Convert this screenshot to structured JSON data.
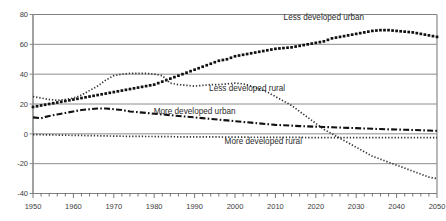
{
  "chart_data": {
    "type": "line",
    "title": "",
    "subtitle": "",
    "xlabel": "",
    "ylabel": "",
    "xlim": [
      1950,
      2050
    ],
    "ylim": [
      -40,
      80
    ],
    "ytick_values": [
      -40,
      -20,
      0,
      20,
      40,
      60,
      80
    ],
    "ytick_labels": [
      "-40",
      "-20",
      "0",
      "20",
      "40",
      "60",
      "80"
    ],
    "xtick_values": [
      1950,
      1960,
      1970,
      1980,
      1990,
      2000,
      2010,
      2020,
      2030,
      2040,
      2050
    ],
    "xtick_labels": [
      "1950",
      "1960",
      "1970",
      "1980",
      "1990",
      "2000",
      "2010",
      "2020",
      "2030",
      "2040",
      "2050"
    ],
    "x_minor_tick_step": 2,
    "grid": "horizontal",
    "grid_color": "#808080",
    "frame_color": "#8a8a8a",
    "legend": "inline-annotations",
    "x": [
      1950,
      1952,
      1954,
      1956,
      1958,
      1960,
      1962,
      1964,
      1966,
      1968,
      1970,
      1972,
      1974,
      1976,
      1978,
      1980,
      1982,
      1984,
      1986,
      1988,
      1990,
      1992,
      1994,
      1996,
      1998,
      2000,
      2002,
      2004,
      2006,
      2008,
      2010,
      2012,
      2014,
      2016,
      2018,
      2020,
      2022,
      2024,
      2026,
      2028,
      2030,
      2032,
      2034,
      2036,
      2038,
      2040,
      2042,
      2044,
      2046,
      2048,
      2050
    ],
    "series": [
      {
        "name": "Less developed urban",
        "style": "dotted-square",
        "color": "#111111",
        "label_x": 2022,
        "label_y": 76,
        "values": [
          18,
          19,
          20,
          21,
          22,
          23,
          24,
          25,
          26,
          27,
          28,
          29,
          30,
          31,
          32,
          33,
          35,
          37,
          39,
          41,
          43,
          45,
          47,
          49,
          50,
          52,
          53,
          54,
          55,
          56,
          57,
          57.5,
          58,
          59,
          60,
          61,
          62,
          64,
          65,
          66,
          67,
          68,
          69,
          69.5,
          69.5,
          69,
          68.5,
          68,
          67,
          66,
          65
        ]
      },
      {
        "name": "Less developed rural",
        "style": "dotted-fine",
        "color": "#333333",
        "label_x": 2003,
        "label_y": 29,
        "values": [
          25,
          24,
          23,
          22.5,
          23,
          24,
          26,
          29,
          32,
          36,
          39,
          40,
          40.5,
          40.5,
          40.5,
          40,
          39,
          34,
          33,
          32.5,
          32,
          32.5,
          33,
          33,
          33.5,
          34,
          33.5,
          32,
          30,
          28,
          25,
          22,
          19,
          15,
          11,
          7,
          3,
          0,
          -3,
          -6,
          -9,
          -12,
          -15,
          -17,
          -19,
          -21,
          -23,
          -25,
          -27,
          -29,
          -30
        ]
      },
      {
        "name": "More developed urban",
        "style": "dashdot",
        "color": "#111111",
        "label_x": 1990,
        "label_y": 13,
        "values": [
          11,
          10.5,
          12,
          13,
          14,
          15,
          16,
          16.5,
          17,
          17,
          16.5,
          16,
          15,
          14.5,
          14,
          13.5,
          13,
          12.5,
          12,
          11.5,
          11,
          10.5,
          10,
          9.5,
          9,
          8.5,
          8,
          7.5,
          7,
          6.5,
          6,
          5.8,
          5.5,
          5.2,
          5,
          4.8,
          4.6,
          4.4,
          4.2,
          4,
          3.8,
          3.6,
          3.4,
          3.2,
          3,
          2.9,
          2.7,
          2.6,
          2.4,
          2.2,
          2
        ]
      },
      {
        "name": "More developed rural",
        "style": "dotted-fine",
        "color": "#333333",
        "label_x": 2007,
        "label_y": -7,
        "values": [
          -0.5,
          -0.6,
          -0.7,
          -0.8,
          -0.9,
          -1,
          -1.1,
          -1.2,
          -1.3,
          -1.4,
          -1.5,
          -1.6,
          -1.7,
          -1.7,
          -1.8,
          -1.8,
          -1.9,
          -1.9,
          -2,
          -2,
          -2,
          -2.1,
          -2.1,
          -2.1,
          -2.2,
          -2.2,
          -2.2,
          -2.3,
          -2.3,
          -2.3,
          -2.4,
          -2.4,
          -2.4,
          -2.4,
          -2.5,
          -2.5,
          -2.5,
          -2.5,
          -2.5,
          -2.6,
          -2.6,
          -2.6,
          -2.6,
          -2.6,
          -2.6,
          -2.6,
          -2.6,
          -2.6,
          -2.6,
          -2.6,
          -2.6
        ]
      }
    ]
  }
}
